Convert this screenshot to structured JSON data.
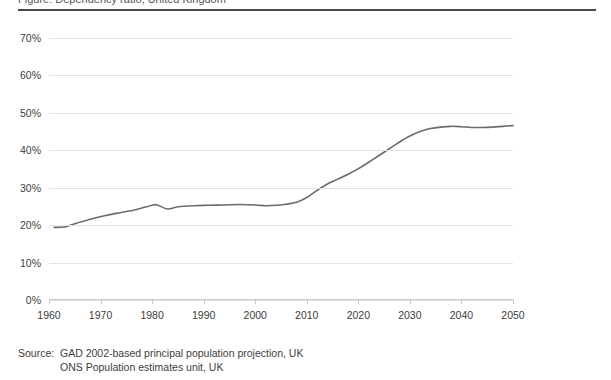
{
  "figure": {
    "title_clipped": "Figure: Dependency ratio, United Kingdom",
    "top_rule_color": "#4a4a4a"
  },
  "source": {
    "label": "Source:",
    "lines": [
      "GAD 2002-based principal population projection, UK",
      "ONS Population estimates unit, UK"
    ]
  },
  "chart_data": {
    "type": "line",
    "title": "",
    "xlabel": "",
    "ylabel": "",
    "xlim": [
      1960,
      2050
    ],
    "ylim": [
      0,
      70
    ],
    "grid": true,
    "legend": "none",
    "line_color": "#6b6b6b",
    "line_width": 1.6,
    "x_ticks": [
      1960,
      1970,
      1980,
      1990,
      2000,
      2010,
      2020,
      2030,
      2040,
      2050
    ],
    "x_tick_labels": [
      "1960",
      "1970",
      "1980",
      "1990",
      "2000",
      "2010",
      "2020",
      "2030",
      "2040",
      "2050"
    ],
    "y_ticks": [
      0,
      10,
      20,
      30,
      40,
      50,
      60,
      70
    ],
    "y_tick_labels": [
      "0%",
      "10%",
      "20%",
      "30%",
      "40%",
      "50%",
      "60%",
      "70%"
    ],
    "series": [
      {
        "name": "Dependency ratio",
        "x": [
          1961,
          1963,
          1965,
          1968,
          1971,
          1974,
          1977,
          1980,
          1981,
          1983,
          1985,
          1988,
          1991,
          1994,
          1997,
          2000,
          2002,
          2004,
          2006,
          2008,
          2010,
          2012,
          2014,
          2016,
          2018,
          2020,
          2022,
          2024,
          2026,
          2028,
          2030,
          2032,
          2034,
          2036,
          2038,
          2040,
          2042,
          2044,
          2046,
          2048,
          2050
        ],
        "values": [
          19.4,
          19.5,
          20.4,
          21.6,
          22.6,
          23.4,
          24.2,
          25.3,
          25.4,
          24.3,
          24.9,
          25.2,
          25.3,
          25.4,
          25.5,
          25.4,
          25.2,
          25.3,
          25.6,
          26.1,
          27.4,
          29.3,
          31.0,
          32.3,
          33.6,
          35.1,
          36.8,
          38.6,
          40.4,
          42.2,
          43.8,
          45.0,
          45.8,
          46.2,
          46.4,
          46.3,
          46.1,
          46.1,
          46.2,
          46.4,
          46.6
        ]
      }
    ]
  }
}
